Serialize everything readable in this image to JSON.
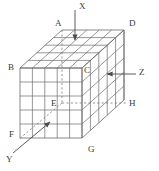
{
  "figure": {
    "kind": "isometric-grid-cuboid",
    "grid": {
      "nx": 5,
      "ny": 5,
      "nz": 5
    },
    "stroke_color": "#6b6b6b",
    "dashed_color": "#6b6b6b",
    "label_color": "#3a3a3a",
    "background": "#ffffff"
  },
  "vertex_labels": [
    {
      "id": "A",
      "text": "A",
      "x": 55,
      "y": 19
    },
    {
      "id": "B",
      "text": "B",
      "x": 8,
      "y": 63
    },
    {
      "id": "C",
      "text": "C",
      "x": 84,
      "y": 66
    },
    {
      "id": "D",
      "text": "D",
      "x": 129,
      "y": 19
    },
    {
      "id": "E",
      "text": "E",
      "x": 51,
      "y": 99
    },
    {
      "id": "F",
      "text": "F",
      "x": 9,
      "y": 130
    },
    {
      "id": "G",
      "text": "G",
      "x": 88,
      "y": 145
    },
    {
      "id": "H",
      "text": "H",
      "x": 129,
      "y": 99
    }
  ],
  "axis_labels": [
    {
      "id": "X",
      "text": "X",
      "x": 79,
      "y": 2
    },
    {
      "id": "Y",
      "text": "Y",
      "x": 6,
      "y": 155
    },
    {
      "id": "Z",
      "text": "Z",
      "x": 139,
      "y": 68
    }
  ],
  "arrows": [
    {
      "id": "x-arrow",
      "from_x": 75,
      "from_y": 10,
      "to_x": 75,
      "to_y": 41,
      "style": "solid"
    },
    {
      "id": "z-arrow",
      "from_x": 136,
      "from_y": 74,
      "to_x": 105,
      "to_y": 74,
      "style": "solid"
    },
    {
      "id": "y-arrow",
      "from_x": 14,
      "from_y": 152,
      "to_x": 52,
      "to_y": 120,
      "style": "solid"
    }
  ],
  "dashed_lines": [
    {
      "id": "ae-hidden-vertical",
      "x1": 62,
      "y1": 30,
      "x2": 62,
      "y2": 103
    },
    {
      "id": "eh-hidden-horizontal",
      "x1": 62,
      "y1": 103,
      "x2": 128,
      "y2": 103
    },
    {
      "id": "ey-diagonal",
      "x1": 62,
      "y1": 103,
      "x2": 20,
      "y2": 138
    }
  ]
}
